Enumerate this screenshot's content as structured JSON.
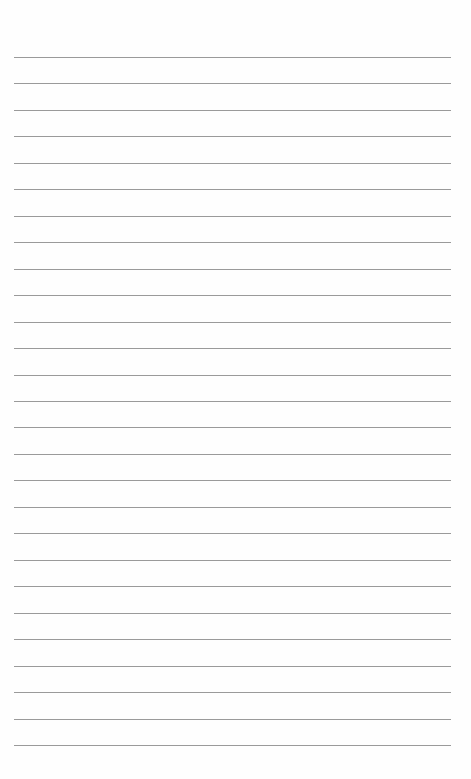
{
  "page": {
    "type": "lined-paper",
    "background_color": "#fefefe",
    "line_color": "#9a9a9a",
    "line_count": 27,
    "first_line_y": 57,
    "line_spacing": 26.46,
    "line_left": 14,
    "line_width": 437
  }
}
